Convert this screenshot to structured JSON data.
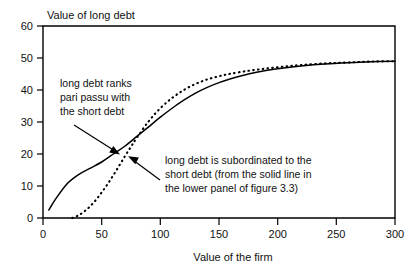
{
  "chart_data": {
    "type": "line",
    "title": "Value of long debt",
    "xlabel": "Value of the firm",
    "ylabel": "Value of long debt",
    "xlim": [
      0,
      300
    ],
    "ylim": [
      0,
      60
    ],
    "grid": false,
    "legend": "none",
    "xticks": [
      0,
      50,
      100,
      150,
      200,
      250,
      300
    ],
    "xtick_labels": [
      "0",
      "50",
      "100",
      "150",
      "200",
      "250",
      "300"
    ],
    "yticks": [
      0,
      10,
      20,
      30,
      40,
      50,
      60
    ],
    "ytick_labels": [
      "0",
      "10",
      "20",
      "30",
      "40",
      "50",
      "60"
    ],
    "series": [
      {
        "name": "long debt ranks pari passu with the short debt",
        "style": "solid",
        "x": [
          5,
          10,
          20,
          30,
          40,
          50,
          60,
          70,
          80,
          90,
          100,
          110,
          120,
          130,
          140,
          150,
          160,
          175,
          190,
          205,
          220,
          240,
          260,
          280,
          300
        ],
        "y": [
          2.5,
          5.5,
          10.5,
          13.5,
          15.5,
          17.5,
          20.0,
          22.5,
          25.5,
          28.5,
          31.5,
          34.3,
          36.8,
          39.0,
          40.8,
          42.3,
          43.5,
          45.0,
          46.1,
          46.9,
          47.5,
          48.1,
          48.5,
          48.8,
          49.0
        ]
      },
      {
        "name": "long debt is subordinated to the short debt",
        "style": "dashed",
        "x": [
          25,
          30,
          35,
          40,
          45,
          50,
          55,
          60,
          65,
          70,
          75,
          80,
          90,
          100,
          110,
          120,
          130,
          140,
          150,
          160,
          175,
          190,
          205,
          220,
          240,
          260,
          280,
          300
        ],
        "y": [
          0.0,
          0.8,
          2.0,
          3.6,
          5.6,
          8.0,
          10.6,
          13.4,
          16.4,
          19.4,
          22.3,
          25.1,
          30.2,
          34.3,
          37.5,
          40.0,
          41.9,
          43.3,
          44.3,
          45.1,
          46.0,
          46.7,
          47.3,
          47.8,
          48.3,
          48.6,
          48.9,
          49.0
        ]
      }
    ],
    "annotations": [
      {
        "id": "pari-passu-note",
        "lines": [
          "long debt ranks",
          "pari passu with",
          "the short debt"
        ],
        "points_to": "solid-line",
        "arrow_from": [
          32,
          34
        ],
        "arrow_to": [
          72,
          22.5
        ]
      },
      {
        "id": "subordinated-note",
        "lines": [
          "long debt is subordinated to the",
          "short debt (from the solid line in",
          "the lower panel of figure 3.3)"
        ],
        "points_to": "dashed-line",
        "arrow_from": [
          132,
          14
        ],
        "arrow_to": [
          79,
          20.5
        ]
      }
    ]
  },
  "colors": {
    "ink": "#000000",
    "background": "#ffffff"
  }
}
